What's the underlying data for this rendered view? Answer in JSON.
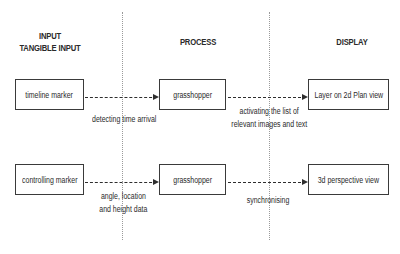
{
  "columns": {
    "input": {
      "title": "INPUT",
      "subtitle": "TANGIBLE INPUT"
    },
    "process": {
      "title": "PROCESS"
    },
    "display": {
      "title": "DISPLAY"
    }
  },
  "rows": [
    {
      "input_box": "timeline marker",
      "input_to_process_label": [
        "detecting time arrival"
      ],
      "process_box": "grasshopper",
      "process_to_display_label": [
        "activating the list of",
        "relevant images and text"
      ],
      "display_box": "Layer on 2d Plan view"
    },
    {
      "input_box": "controlling marker",
      "input_to_process_label": [
        "angle, location",
        "and height data"
      ],
      "process_box": "grasshopper",
      "process_to_display_label": [
        "synchronising"
      ],
      "display_box": "3d perspective view"
    }
  ],
  "colors": {
    "line": "#2e2e2e",
    "divider": "#9a9a9a",
    "background": "#ffffff"
  }
}
